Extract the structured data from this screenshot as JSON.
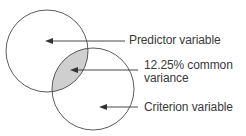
{
  "diagram": {
    "type": "venn",
    "circles": [
      {
        "id": "predictor",
        "name": "Predictor variable",
        "cx": 47,
        "cy": 51,
        "r": 41
      },
      {
        "id": "criterion",
        "name": "Criterion variable",
        "cx": 93,
        "cy": 89,
        "r": 41
      }
    ],
    "overlap": {
      "name": "12.25% common variance",
      "fill": "#cfcfcf"
    },
    "labels": {
      "predictor": "Predictor variable",
      "common_line1": "12.25% common",
      "common_line2": "variance",
      "criterion": "Criterion variable"
    },
    "colors": {
      "stroke": "#4a4a4a",
      "overlap_fill": "#cfcfcf",
      "text": "#3a3a3a",
      "arrow": "#333333"
    }
  }
}
